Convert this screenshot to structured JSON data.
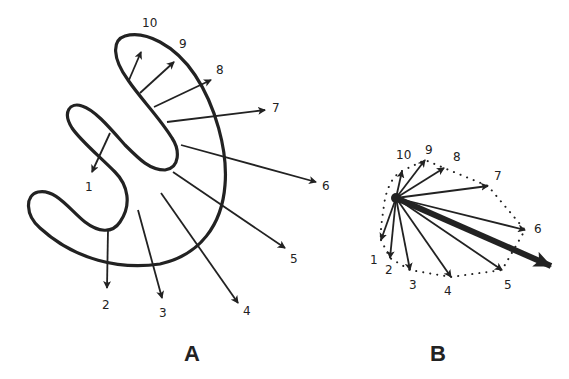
{
  "figure": {
    "panels": [
      {
        "label": "A",
        "arrows": [
          {
            "id": "1",
            "label": "1"
          },
          {
            "id": "2",
            "label": "2"
          },
          {
            "id": "3",
            "label": "3"
          },
          {
            "id": "4",
            "label": "4"
          },
          {
            "id": "5",
            "label": "5"
          },
          {
            "id": "6",
            "label": "6"
          },
          {
            "id": "7",
            "label": "7"
          },
          {
            "id": "8",
            "label": "8"
          },
          {
            "id": "9",
            "label": "9"
          },
          {
            "id": "10",
            "label": "10"
          }
        ]
      },
      {
        "label": "B",
        "arrows": [
          {
            "id": "1",
            "label": "1"
          },
          {
            "id": "2",
            "label": "2"
          },
          {
            "id": "3",
            "label": "3"
          },
          {
            "id": "4",
            "label": "4"
          },
          {
            "id": "5",
            "label": "5"
          },
          {
            "id": "6",
            "label": "6"
          },
          {
            "id": "7",
            "label": "7"
          },
          {
            "id": "8",
            "label": "8"
          },
          {
            "id": "9",
            "label": "9"
          },
          {
            "id": "10",
            "label": "10"
          }
        ]
      }
    ],
    "colors": {
      "ink": "#222222",
      "background": "#ffffff"
    }
  }
}
